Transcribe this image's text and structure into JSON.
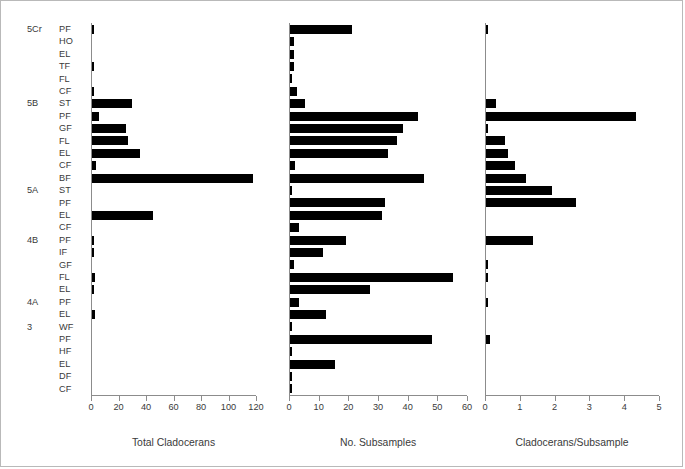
{
  "chart_data": {
    "type": "bar",
    "orientation": "horizontal",
    "title": "",
    "ylabel": "",
    "grid": false,
    "legend": false,
    "categories": [
      {
        "group": "5Cr",
        "sub": "PF"
      },
      {
        "group": "",
        "sub": "HO"
      },
      {
        "group": "",
        "sub": "EL"
      },
      {
        "group": "",
        "sub": "TF"
      },
      {
        "group": "",
        "sub": "FL"
      },
      {
        "group": "",
        "sub": "CF"
      },
      {
        "group": "5B",
        "sub": "ST"
      },
      {
        "group": "",
        "sub": "PF"
      },
      {
        "group": "",
        "sub": "GF"
      },
      {
        "group": "",
        "sub": "FL"
      },
      {
        "group": "",
        "sub": "EL"
      },
      {
        "group": "",
        "sub": "CF"
      },
      {
        "group": "",
        "sub": "BF"
      },
      {
        "group": "5A",
        "sub": "ST"
      },
      {
        "group": "",
        "sub": "PF"
      },
      {
        "group": "",
        "sub": "EL"
      },
      {
        "group": "",
        "sub": "CF"
      },
      {
        "group": "4B",
        "sub": "PF"
      },
      {
        "group": "",
        "sub": "IF"
      },
      {
        "group": "",
        "sub": "GF"
      },
      {
        "group": "",
        "sub": "FL"
      },
      {
        "group": "",
        "sub": "EL"
      },
      {
        "group": "4A",
        "sub": "PF"
      },
      {
        "group": "",
        "sub": "EL"
      },
      {
        "group": "3",
        "sub": "WF"
      },
      {
        "group": "",
        "sub": "PF"
      },
      {
        "group": "",
        "sub": "HF"
      },
      {
        "group": "",
        "sub": "EL"
      },
      {
        "group": "",
        "sub": "DF"
      },
      {
        "group": "",
        "sub": "CF"
      }
    ],
    "panels": [
      {
        "name": "total-cladocerans",
        "xlabel": "Total Cladocerans",
        "xlim": [
          0,
          120
        ],
        "xticks": [
          0,
          20,
          40,
          60,
          80,
          100,
          120
        ],
        "values": [
          1.5,
          0,
          0,
          1.5,
          0,
          1.5,
          29,
          5,
          25,
          26,
          35,
          3,
          117,
          0,
          0,
          44,
          0,
          1.5,
          1,
          0,
          2.5,
          1,
          0,
          2,
          0,
          0,
          0,
          0,
          0,
          0
        ]
      },
      {
        "name": "no-subsamples",
        "xlabel": "No. Subsamples",
        "xlim": [
          0,
          60
        ],
        "xticks": [
          0,
          10,
          20,
          30,
          40,
          50,
          60
        ],
        "values": [
          21,
          1.2,
          1.2,
          1.2,
          0.6,
          2.5,
          5,
          43,
          38,
          36,
          33,
          1.8,
          45,
          0.6,
          32,
          31,
          3,
          19,
          11,
          1.2,
          55,
          27,
          3,
          12,
          0.6,
          48,
          0.8,
          15,
          0.8,
          0.6
        ]
      },
      {
        "name": "cladocerans-per-subsample",
        "xlabel": "Cladocerans/Subsample",
        "xlim": [
          0,
          5
        ],
        "xticks": [
          0,
          1,
          2,
          3,
          4,
          5
        ],
        "values": [
          0.07,
          0,
          0,
          0,
          0,
          0,
          0.3,
          4.3,
          0.06,
          0.55,
          0.62,
          0.82,
          1.15,
          1.9,
          2.6,
          0,
          0,
          1.35,
          0,
          0.05,
          0.05,
          0,
          0.06,
          0,
          0,
          0.12,
          0,
          0,
          0,
          0
        ]
      }
    ]
  }
}
